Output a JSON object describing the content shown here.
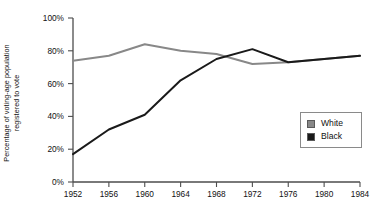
{
  "chart_data": {
    "type": "line",
    "title": "",
    "xlabel": "",
    "ylabel": "Percentage of voting-age population registered to vote",
    "ylabel_line1": "Percentage of voting-age population",
    "ylabel_line2": "registered to vote",
    "categories": [
      1952,
      1956,
      1960,
      1964,
      1968,
      1972,
      1976,
      1980,
      1984
    ],
    "x": [
      1952,
      1956,
      1960,
      1964,
      1968,
      1972,
      1976,
      1980,
      1984
    ],
    "xlim": [
      1952,
      1984
    ],
    "ylim": [
      0,
      100
    ],
    "grid": false,
    "legend_position": "right",
    "xticklabels": [
      "1952",
      "1956",
      "1960",
      "1964",
      "1968",
      "1972",
      "1976",
      "1980",
      "1984"
    ],
    "yticklabels": [
      "0%",
      "20%",
      "40%",
      "60%",
      "80%",
      "100%"
    ],
    "yticks": [
      0,
      20,
      40,
      60,
      80,
      100
    ],
    "series": [
      {
        "name": "White",
        "color": "#888888",
        "values": [
          74,
          77,
          84,
          80,
          78,
          72,
          73,
          75,
          77
        ]
      },
      {
        "name": "Black",
        "color": "#1a1a1a",
        "values": [
          17,
          32,
          41,
          62,
          75,
          81,
          73,
          75,
          77
        ]
      }
    ]
  },
  "legend": {
    "items": [
      {
        "label": "White",
        "color": "#888888"
      },
      {
        "label": "Black",
        "color": "#1a1a1a"
      }
    ]
  }
}
